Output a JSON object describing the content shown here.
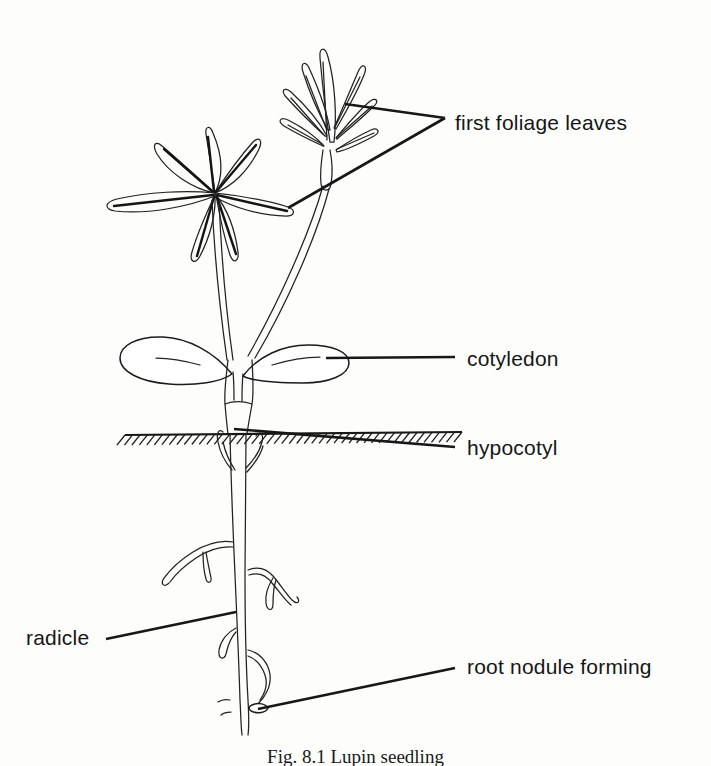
{
  "figure": {
    "kind": "botanical-line-drawing",
    "subject": "Lupin seedling",
    "caption": "Fig. 8.1   Lupin seedling",
    "ink_color": "#1b1b1b",
    "background_color": "#fdfdfc"
  },
  "labels": {
    "first_foliage_leaves": "first foliage leaves",
    "cotyledon": "cotyledon",
    "hypocotyl": "hypocotyl",
    "radicle": "radicle",
    "root_nodule_forming": "root nodule forming"
  },
  "parts": [
    {
      "id": "first-foliage-leaves",
      "label": "first foliage leaves",
      "label_x": 455,
      "label_y": 112,
      "align": "left",
      "leader": "branched",
      "leader_vertex": [
        445,
        118
      ],
      "leader_targets": [
        [
          345,
          104
        ],
        [
          288,
          208
        ]
      ]
    },
    {
      "id": "cotyledon",
      "label": "cotyledon",
      "label_x": 467,
      "label_y": 348,
      "align": "left",
      "leader": "straight",
      "leader_from": [
        326,
        358
      ],
      "leader_to": [
        455,
        357
      ]
    },
    {
      "id": "hypocotyl",
      "label": "hypocotyl",
      "label_x": 467,
      "label_y": 437,
      "align": "left",
      "leader": "straight",
      "leader_from": [
        234,
        429
      ],
      "leader_to": [
        455,
        447
      ]
    },
    {
      "id": "radicle",
      "label": "radicle",
      "label_x": 26,
      "label_y": 627,
      "align": "left",
      "leader": "straight",
      "leader_from": [
        236,
        612
      ],
      "leader_to": [
        106,
        639
      ]
    },
    {
      "id": "root-nodule-forming",
      "label": "root nodule forming",
      "label_x": 467,
      "label_y": 656,
      "align": "left",
      "leader": "straight",
      "leader_from": [
        258,
        709
      ],
      "leader_to": [
        455,
        668
      ]
    }
  ],
  "soil": {
    "line_y": 434,
    "x_start": 125,
    "x_end": 462,
    "hatch_count": 46,
    "hatch_length": 13
  },
  "anatomy": {
    "palmate_leaf_center": [
      215,
      193
    ],
    "palmate_leaflet_count": 7,
    "bud_cluster_center": [
      330,
      95
    ],
    "cotyledon_count": 2,
    "taproot_top_y": 434,
    "taproot_tip_y": 735,
    "lateral_root_count": 6
  }
}
